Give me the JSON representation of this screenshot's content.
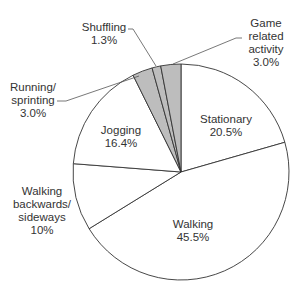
{
  "chart_data": {
    "type": "pie",
    "title": "",
    "center": [
      181,
      172
    ],
    "radius": 108,
    "start_angle_deg": 0,
    "direction": "clockwise",
    "slices": [
      {
        "name": "Stationary",
        "value": 20.5,
        "label": "20.5%",
        "fill": "#ffffff"
      },
      {
        "name": "Walking",
        "value": 45.5,
        "label": "45.5%",
        "fill": "#ffffff"
      },
      {
        "name": "Walking backwards/ sideways",
        "value": 10,
        "label": "10%",
        "fill": "#ffffff"
      },
      {
        "name": "Jogging",
        "value": 16.4,
        "label": "16.4%",
        "fill": "#ffffff"
      },
      {
        "name": "Running/ sprinting",
        "value": 3.0,
        "label": "3.0%",
        "fill": "#bdbdbd"
      },
      {
        "name": "Shuffling",
        "value": 1.3,
        "label": "1.3%",
        "fill": "#bdbdbd"
      },
      {
        "name": "Game related activity",
        "value": 3.0,
        "label": "3.0%",
        "fill": "#bdbdbd"
      }
    ],
    "legend": "none"
  },
  "labels": [
    {
      "slice": 0,
      "lines": [
        "Stationary",
        "20.5%"
      ],
      "x": 226,
      "y": 123,
      "anchor": "middle"
    },
    {
      "slice": 1,
      "lines": [
        "Walking",
        "45.5%"
      ],
      "x": 193,
      "y": 228,
      "anchor": "middle"
    },
    {
      "slice": 2,
      "lines": [
        "Walking",
        "backwards/",
        "sideways",
        "10%"
      ],
      "x": 42,
      "y": 195,
      "anchor": "middle"
    },
    {
      "slice": 3,
      "lines": [
        "Jogging",
        "16.4%"
      ],
      "x": 121,
      "y": 134,
      "anchor": "middle"
    },
    {
      "slice": 4,
      "lines": [
        "Running/",
        "sprinting",
        "3.0%"
      ],
      "x": 33,
      "y": 91,
      "anchor": "middle"
    },
    {
      "slice": 5,
      "lines": [
        "Shuffling",
        "1.3%"
      ],
      "x": 104,
      "y": 31,
      "anchor": "middle"
    },
    {
      "slice": 6,
      "lines": [
        "Game",
        "related",
        "activity",
        "3.0%"
      ],
      "x": 266,
      "y": 27,
      "anchor": "middle"
    }
  ],
  "leaders": [
    {
      "slice": 4,
      "points": [
        [
          57,
          101
        ],
        [
          66,
          101
        ],
        [
          139,
          76
        ]
      ]
    },
    {
      "slice": 5,
      "points": [
        [
          128,
          29
        ],
        [
          133,
          29
        ],
        [
          156,
          66
        ]
      ]
    },
    {
      "slice": 6,
      "points": [
        [
          242,
          38
        ],
        [
          236,
          38
        ],
        [
          173,
          64
        ]
      ]
    }
  ],
  "style": {
    "stroke": "#333333",
    "stroke_width": 0.9,
    "leader_color": "#555555",
    "label_color": "#333333",
    "line_height": 13
  }
}
